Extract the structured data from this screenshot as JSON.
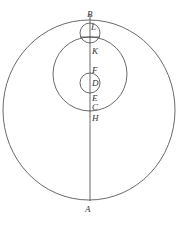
{
  "diagram": {
    "type": "geometric-circles",
    "labels": {
      "B": "B",
      "L": "L",
      "K": "K",
      "F": "F",
      "D": "D",
      "E": "E",
      "C": "C",
      "H": "H",
      "A": "A"
    },
    "stroke_color": "#444444"
  }
}
